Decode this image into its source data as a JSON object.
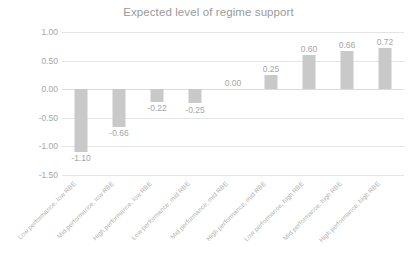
{
  "chart_data": {
    "type": "bar",
    "title": "Expected level of regime support",
    "xlabel": "",
    "ylabel": "",
    "ylim": [
      -1.5,
      1.0
    ],
    "ytick_labels": [
      "1.00",
      "0.50",
      "0.00",
      "-0.50",
      "-1.00",
      "-1.50"
    ],
    "ytick_values": [
      1.0,
      0.5,
      0.0,
      -0.5,
      -1.0,
      -1.5
    ],
    "grid": true,
    "legend": "none",
    "categories": [
      "Low performance, low RBE",
      "Mid performance, low RBE",
      "High performance, low RBE",
      "Low performance, mid RBE",
      "Mid performance, mid RBE",
      "High performance, mid RBE",
      "Low performance, high RBE",
      "Mid performance, high RBE",
      "High performance, high RBE"
    ],
    "values": [
      -1.1,
      -0.66,
      -0.22,
      -0.25,
      0.0,
      0.25,
      0.6,
      0.66,
      0.72
    ],
    "value_labels": [
      "-1.10",
      "-0.66",
      "-0.22",
      "-0.25",
      "0.00",
      "0.25",
      "0.60",
      "0.66",
      "0.72"
    ],
    "colors": {
      "bar": "#c9c9c9",
      "gridline": "#e4e4e4",
      "text": "#a6a6a6",
      "title": "#9a9a9a",
      "background": "#ffffff"
    }
  }
}
